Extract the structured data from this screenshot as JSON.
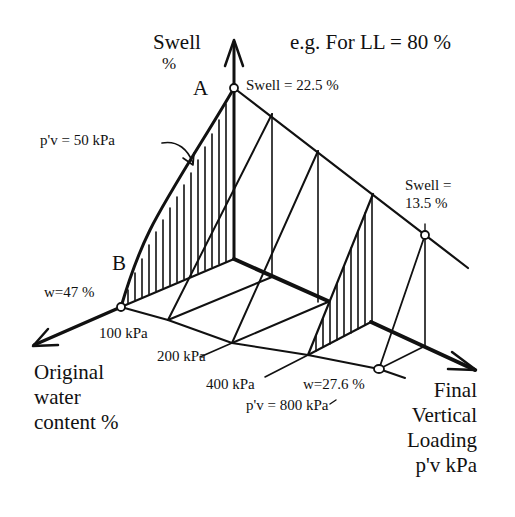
{
  "title": "e.g. For LL = 80 %",
  "axes": {
    "vertical": {
      "label_line1": "Swell",
      "label_line2": "%"
    },
    "left": {
      "label_line1": "Original",
      "label_line2": "water",
      "label_line3": "content %"
    },
    "right": {
      "label_line1": "Final",
      "label_line2": "Vertical",
      "label_line3": "Loading",
      "label_line4": "p'v  kPa"
    }
  },
  "points": {
    "A": {
      "name": "A",
      "annotation": "Swell = 22.5 %"
    },
    "B": {
      "name": "B",
      "annotation": "w=47 %"
    },
    "C": {
      "annotation_line1": "Swell =",
      "annotation_line2": "13.5 %"
    },
    "D": {
      "annotation": "w=27.6 %"
    }
  },
  "curve_label": "p'v = 50 kPa",
  "load_labels": [
    "100 kPa",
    "200 kPa",
    "400 kPa"
  ],
  "final_load_label": "p'v = 800 kPa",
  "colors": {
    "ink": "#111111",
    "background": "#ffffff"
  }
}
